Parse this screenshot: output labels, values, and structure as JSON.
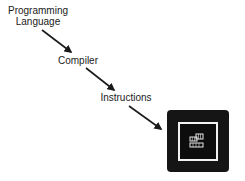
{
  "diagram": {
    "type": "flow",
    "nodes": [
      {
        "id": "programming_language",
        "label": "Programming Language",
        "lines": [
          "Programming",
          "Language"
        ]
      },
      {
        "id": "compiler",
        "label": "Compiler"
      },
      {
        "id": "instructions",
        "label": "Instructions"
      },
      {
        "id": "computer_chip",
        "label": "",
        "icon": "cpu-chip-icon"
      }
    ],
    "edges": [
      {
        "from": "programming_language",
        "to": "compiler"
      },
      {
        "from": "compiler",
        "to": "instructions"
      },
      {
        "from": "instructions",
        "to": "computer_chip"
      }
    ],
    "colors": {
      "text": "#1a1a1a",
      "arrow": "#1a1a1a",
      "chip_body": "#151515",
      "chip_frame": "#f2f2f2",
      "background": "#ffffff"
    }
  }
}
